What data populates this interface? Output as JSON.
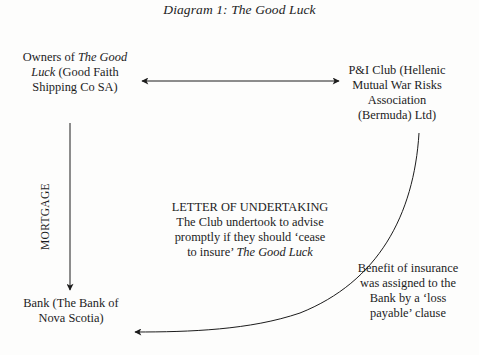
{
  "diagram": {
    "title": "Diagram 1: The Good Luck",
    "nodes": {
      "owners": {
        "line1_prefix": "Owners of ",
        "line1_italic": "The Good",
        "line2_italic": "Luck",
        "line2_suffix": " (Good Faith",
        "line3": "Shipping Co SA)"
      },
      "pi_club": {
        "line1": "P&I Club (Hellenic",
        "line2": "Mutual War Risks",
        "line3": "Association",
        "line4": "(Bermuda) Ltd)"
      },
      "bank": {
        "line1": "Bank (The Bank of",
        "line2": "Nova Scotia)"
      }
    },
    "edges": {
      "owners_pi": {
        "type": "double-arrow",
        "label": ""
      },
      "owners_bank": {
        "type": "arrow",
        "label": "MORTGAGE"
      },
      "pi_bank": {
        "type": "curved-arrow",
        "label_line1": "Benefit of insurance",
        "label_line2": "was assigned to the",
        "label_line3": "Bank by a ‘loss",
        "label_line4": "payable’ clause"
      }
    },
    "letter_of_undertaking": {
      "heading": "LETTER OF UNDERTAKING",
      "line1": "The Club undertook to advise",
      "line2": "promptly if they should ‘cease",
      "line3_prefix": "to insure’ ",
      "line3_italic": "The Good Luck"
    },
    "colors": {
      "ink": "#1c1c1c",
      "paper": "#fdfdfc"
    }
  }
}
